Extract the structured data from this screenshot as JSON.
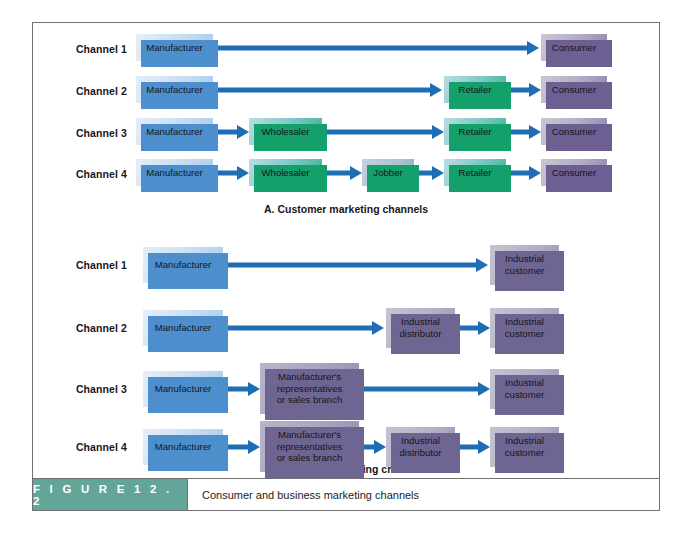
{
  "figure": {
    "badge_label": "F I G U R E   1 2 . 2",
    "caption": "Consumer and business marketing channels"
  },
  "sections": [
    {
      "id": "consumer",
      "caption": "A. Customer marketing channels",
      "rows": [
        {
          "label": "Channel 1",
          "nodes": [
            "Manufacturer",
            "Consumer"
          ]
        },
        {
          "label": "Channel 2",
          "nodes": [
            "Manufacturer",
            "Retailer",
            "Consumer"
          ]
        },
        {
          "label": "Channel 3",
          "nodes": [
            "Manufacturer",
            "Wholesaler",
            "Retailer",
            "Consumer"
          ]
        },
        {
          "label": "Channel 4",
          "nodes": [
            "Manufacturer",
            "Wholesaler",
            "Jobber",
            "Retailer",
            "Consumer"
          ]
        }
      ]
    },
    {
      "id": "business",
      "caption": "B. Business marketing channels",
      "rows": [
        {
          "label": "Channel 1",
          "nodes": [
            "Manufacturer",
            "Industrial customer"
          ]
        },
        {
          "label": "Channel 2",
          "nodes": [
            "Manufacturer",
            "Industrial distributor",
            "Industrial customer"
          ]
        },
        {
          "label": "Channel 3",
          "nodes": [
            "Manufacturer",
            "Manufacturer's representatives or sales branch",
            "Industrial customer"
          ]
        },
        {
          "label": "Channel 4",
          "nodes": [
            "Manufacturer",
            "Manufacturer's representatives or sales branch",
            "Industrial distributor",
            "Industrial customer"
          ]
        }
      ]
    }
  ],
  "labels": {
    "channel_1": "Channel 1",
    "channel_2": "Channel 2",
    "channel_3": "Channel 3",
    "channel_4": "Channel 4",
    "manufacturer": "Manufacturer",
    "wholesaler": "Wholesaler",
    "jobber": "Jobber",
    "retailer": "Retailer",
    "consumer": "Consumer",
    "industrial_distributor_line1": "Industrial",
    "industrial_distributor_line2": "distributor",
    "industrial_customer_line1": "Industrial",
    "industrial_customer_line2": "customer",
    "reps_line1": "Manufacturer's",
    "reps_line2": "representatives",
    "reps_line3": "or sales branch",
    "section_a": "A. Customer marketing channels",
    "section_b": "B. Business marketing channels"
  },
  "colors": {
    "arrow": "#1f6db5",
    "manufacturer_shadow": "#4c8fcc",
    "channel_shadow": "#13a06a",
    "consumer_shadow": "#6e5f93",
    "industrial_shadow": "#6f6592",
    "badge_bg": "#63a699",
    "frame_border": "#6f7072"
  }
}
